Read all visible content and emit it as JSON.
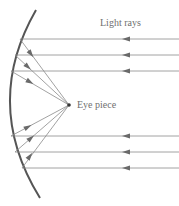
{
  "diagram": {
    "type": "concave mirror reflecting parallel light rays to a focal point (eye piece)",
    "labels": {
      "light_rays": "Light rays",
      "eye_piece": "Eye piece"
    },
    "colors": {
      "mirror": "#555555",
      "rays": "#8a8a8a",
      "arrows": "#6a6a6a",
      "focal_point": "#333333",
      "text": "#6f6f6f"
    },
    "mirror": {
      "top": [
        36,
        10
      ],
      "control": [
        -18,
        104
      ],
      "bottom": [
        40,
        198
      ]
    },
    "focal_point": [
      69,
      105
    ],
    "incoming_rays": [
      {
        "y": 39,
        "x_mirror": 20
      },
      {
        "y": 55,
        "x_mirror": 15
      },
      {
        "y": 71,
        "x_mirror": 11
      },
      {
        "y": 136,
        "x_mirror": 11
      },
      {
        "y": 152,
        "x_mirror": 15
      },
      {
        "y": 168,
        "x_mirror": 22
      }
    ],
    "ray_count": 6,
    "direction": "right-to-left incoming, reflected toward focal point"
  }
}
